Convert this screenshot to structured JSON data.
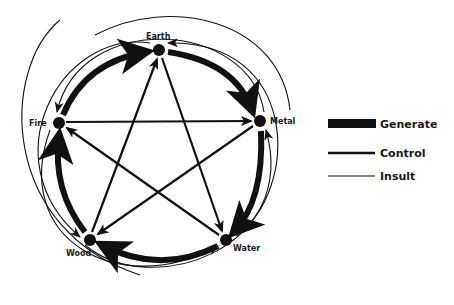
{
  "diagram": {
    "nodes": [
      {
        "id": "earth",
        "label": "Earth",
        "x": 159,
        "y": 50
      },
      {
        "id": "metal",
        "label": "Metal",
        "x": 260,
        "y": 121
      },
      {
        "id": "water",
        "label": "Water",
        "x": 226,
        "y": 240
      },
      {
        "id": "wood",
        "label": "Wood",
        "x": 90,
        "y": 240
      },
      {
        "id": "fire",
        "label": "Fire",
        "x": 59,
        "y": 123
      }
    ],
    "edges": {
      "generate": [
        [
          "fire",
          "earth"
        ],
        [
          "earth",
          "metal"
        ],
        [
          "metal",
          "water"
        ],
        [
          "water",
          "wood"
        ],
        [
          "wood",
          "fire"
        ]
      ],
      "control": [
        [
          "fire",
          "metal"
        ],
        [
          "metal",
          "wood"
        ],
        [
          "wood",
          "earth"
        ],
        [
          "earth",
          "water"
        ],
        [
          "water",
          "fire"
        ]
      ],
      "insult": [
        [
          "metal",
          "fire"
        ],
        [
          "water",
          "earth"
        ],
        [
          "wood",
          "metal"
        ],
        [
          "fire",
          "water"
        ],
        [
          "earth",
          "wood"
        ]
      ]
    }
  },
  "legend": {
    "items": [
      {
        "label": "Generate",
        "style": "thick"
      },
      {
        "label": "Control",
        "style": "medium"
      },
      {
        "label": "Insult",
        "style": "thin"
      }
    ]
  },
  "colors": {
    "ink": "#111111",
    "background": "#ffffff"
  }
}
